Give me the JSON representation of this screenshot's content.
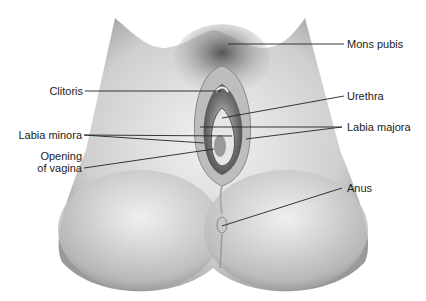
{
  "diagram": {
    "labels": {
      "mons_pubis": "Mons pubis",
      "clitoris": "Clitoris",
      "urethra": "Urethra",
      "labia_minora": "Labia minora",
      "labia_majora": "Labia majora",
      "opening_of_vagina_line1": "Opening",
      "opening_of_vagina_line2": "of vagina",
      "anus": "Anus"
    },
    "colors": {
      "line": "#222222",
      "text": "#222222",
      "background": "#ffffff"
    }
  }
}
